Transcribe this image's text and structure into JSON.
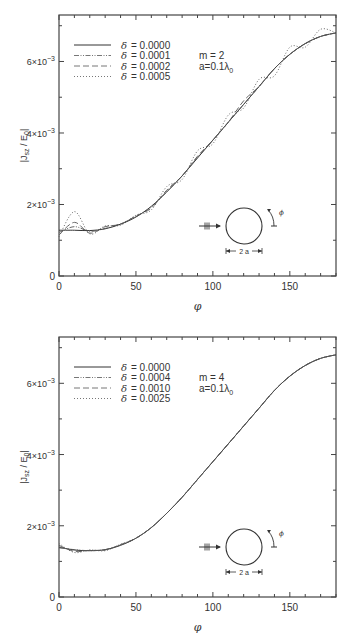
{
  "chart_data": [
    {
      "type": "line",
      "title": "",
      "xlabel": "φ",
      "ylabel": "|J_sz / E_0|",
      "xlim": [
        0,
        180
      ],
      "ylim": [
        0,
        0.0073
      ],
      "x_ticks": [
        "0",
        "50",
        "100",
        "150"
      ],
      "y_ticks": [
        "0",
        "2×10⁻³",
        "4×10⁻³",
        "6×10⁻³"
      ],
      "grid": false,
      "legend_position": "upper left",
      "annotation": {
        "m": "m = 2",
        "a": "a=0.1λ",
        "a_sub": "0"
      },
      "inset": {
        "label": "2 a"
      },
      "x": [
        0,
        10,
        20,
        30,
        40,
        50,
        60,
        70,
        80,
        90,
        100,
        110,
        120,
        130,
        140,
        150,
        160,
        170,
        180
      ],
      "series": [
        {
          "name": "δ = 0.0000",
          "style": "solid",
          "values": [
            0.00128,
            0.00128,
            0.00127,
            0.00132,
            0.00145,
            0.00165,
            0.00195,
            0.00235,
            0.0028,
            0.0033,
            0.0038,
            0.0043,
            0.0048,
            0.0053,
            0.0058,
            0.0062,
            0.0065,
            0.0067,
            0.0068
          ]
        },
        {
          "name": "δ = 0.0001",
          "style": "dash-dot-dot",
          "values": [
            0.00122,
            0.00138,
            0.00125,
            0.00133,
            0.00146,
            0.00166,
            0.00193,
            0.00236,
            0.0028,
            0.00332,
            0.0038,
            0.0043,
            0.0048,
            0.0053,
            0.0058,
            0.0062,
            0.0065,
            0.0067,
            0.0068
          ]
        },
        {
          "name": "δ = 0.0002",
          "style": "dashed",
          "values": [
            0.00115,
            0.0015,
            0.0012,
            0.00138,
            0.00145,
            0.00168,
            0.0019,
            0.0024,
            0.0028,
            0.00335,
            0.0038,
            0.0043,
            0.0049,
            0.0053,
            0.0058,
            0.0062,
            0.0065,
            0.0067,
            0.0068
          ]
        },
        {
          "name": "δ = 0.0005",
          "style": "dotted",
          "values": [
            0.0011,
            0.0018,
            0.00118,
            0.0014,
            0.00142,
            0.0017,
            0.00185,
            0.0025,
            0.0027,
            0.0035,
            0.0037,
            0.0045,
            0.0047,
            0.0055,
            0.0056,
            0.0064,
            0.0064,
            0.0069,
            0.0068
          ]
        }
      ]
    },
    {
      "type": "line",
      "title": "",
      "xlabel": "φ",
      "ylabel": "|J_sz / E_0|",
      "xlim": [
        0,
        180
      ],
      "ylim": [
        0,
        0.0073
      ],
      "x_ticks": [
        "0",
        "50",
        "100",
        "150"
      ],
      "y_ticks": [
        "0",
        "2×10⁻³",
        "4×10⁻³",
        "6×10⁻³"
      ],
      "grid": false,
      "legend_position": "upper left",
      "annotation": {
        "m": "m = 4",
        "a": "a=0.1λ",
        "a_sub": "0"
      },
      "inset": {
        "label": "2 a"
      },
      "x": [
        0,
        10,
        20,
        30,
        40,
        50,
        60,
        70,
        80,
        90,
        100,
        110,
        120,
        130,
        140,
        150,
        160,
        170,
        180
      ],
      "series": [
        {
          "name": "δ = 0.0000",
          "style": "solid",
          "values": [
            0.0014,
            0.00132,
            0.0013,
            0.00133,
            0.00145,
            0.00165,
            0.00195,
            0.00235,
            0.0028,
            0.0033,
            0.0038,
            0.0043,
            0.0048,
            0.0053,
            0.0058,
            0.0062,
            0.0065,
            0.0067,
            0.0068
          ]
        },
        {
          "name": "δ = 0.0004",
          "style": "dash-dot-dot",
          "values": [
            0.00138,
            0.00133,
            0.0013,
            0.00133,
            0.00146,
            0.00165,
            0.00195,
            0.00235,
            0.0028,
            0.0033,
            0.0038,
            0.0043,
            0.0048,
            0.0053,
            0.0058,
            0.0062,
            0.0065,
            0.0067,
            0.0068
          ]
        },
        {
          "name": "δ = 0.0010",
          "style": "dashed",
          "values": [
            0.00145,
            0.00128,
            0.00131,
            0.00132,
            0.00147,
            0.00165,
            0.00195,
            0.00235,
            0.0028,
            0.0033,
            0.0038,
            0.0043,
            0.0048,
            0.0053,
            0.0058,
            0.0062,
            0.0065,
            0.0067,
            0.0068
          ]
        },
        {
          "name": "δ = 0.0025",
          "style": "dotted",
          "values": [
            0.0015,
            0.00125,
            0.00132,
            0.0013,
            0.00148,
            0.00165,
            0.00195,
            0.00235,
            0.0028,
            0.0033,
            0.0038,
            0.0043,
            0.0048,
            0.0053,
            0.0058,
            0.0062,
            0.0065,
            0.0067,
            0.0068
          ]
        }
      ]
    }
  ]
}
